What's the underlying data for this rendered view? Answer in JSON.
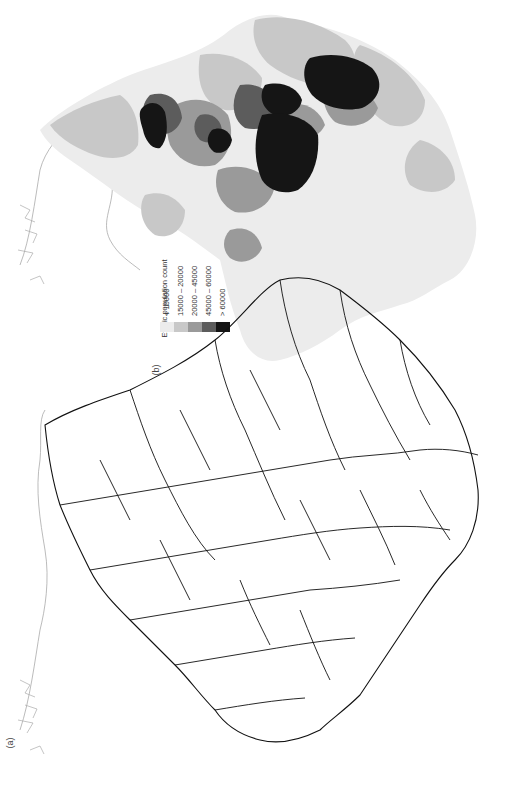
{
  "figure": {
    "orientation": "rotated 90 degrees counter-clockwise",
    "panels": [
      {
        "id": "a",
        "label": "(a)",
        "description": "Boundary outline map of administrative areas"
      },
      {
        "id": "b",
        "label": "(b)",
        "description": "Choropleth of ethnic population count by area"
      }
    ]
  },
  "legend": {
    "title": "Ethnic population count",
    "classes": [
      {
        "label": "< 15000",
        "color": "#ececec"
      },
      {
        "label": "15000 – 20000",
        "color": "#c8c8c8"
      },
      {
        "label": "20000 – 45000",
        "color": "#9a9a9a"
      },
      {
        "label": "45000 – 60000",
        "color": "#5c5c5c"
      },
      {
        "label": "> 60000",
        "color": "#151515"
      }
    ]
  },
  "colors": {
    "outline": "#111111",
    "coast": "#9a9a9a",
    "background": "#ffffff"
  }
}
